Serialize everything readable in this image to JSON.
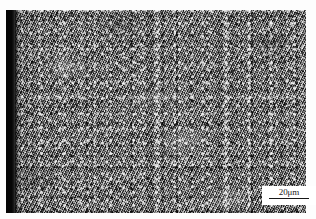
{
  "figure": {
    "kind": "optical-micrograph",
    "plate": {
      "left_edge_band": "black",
      "texture": "fine equiaxed speckled grains, grey"
    },
    "colors": {
      "page_background": "#ffffff",
      "micrograph_mid_grey": "#737373",
      "edge_band_black": "#050505",
      "scale_box_background": "#ffffff",
      "scale_text": "#1a1a1a",
      "scale_rule": "#161616"
    }
  },
  "scale_bar": {
    "label": "20μm",
    "value": 20,
    "unit": "μm",
    "position": "bottom-right"
  }
}
